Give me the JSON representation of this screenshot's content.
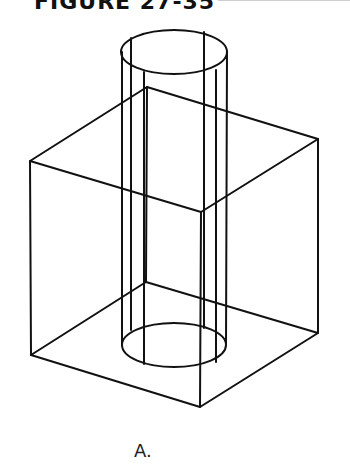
{
  "figure": {
    "title": "FIGURE 27-35",
    "caption": "A.",
    "stroke_color": "#111111",
    "background": "#ffffff"
  },
  "drawing": {
    "description": "Wireframe isometric box with a vertical cylinder passing through it",
    "box": {
      "top": {
        "back": [
          147,
          87
        ],
        "left": [
          30,
          161
        ],
        "right": [
          318,
          139
        ],
        "front": [
          201,
          212
        ]
      },
      "bottom": {
        "back": [
          146,
          282
        ],
        "left": [
          31,
          355
        ],
        "right": [
          318,
          333
        ],
        "front": [
          200,
          407
        ]
      }
    },
    "cylinder": {
      "top_ellipse": {
        "cx": 174,
        "cy": 52,
        "rx": 53,
        "ry": 22
      },
      "bottom_ellipse": {
        "cx": 174,
        "cy": 345,
        "rx": 52,
        "ry": 22
      }
    }
  }
}
